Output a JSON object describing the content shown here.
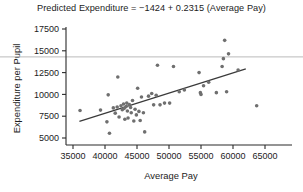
{
  "chart_data": {
    "type": "scatter",
    "title": "Predicted Expenditure = −1424 + 0.2315 (Average Pay)",
    "xlabel": "Average Pay",
    "ylabel": "Expenditure per Pupil",
    "xlim": [
      33500,
      66500
    ],
    "ylim": [
      4600,
      18100
    ],
    "xticks": [
      35000,
      40000,
      45000,
      50000,
      55000,
      60000,
      65000
    ],
    "yticks": [
      5000,
      7500,
      10000,
      12500,
      15000,
      17500
    ],
    "xtick_labels": [
      "35000",
      "40000",
      "45000",
      "50000",
      "55000",
      "60000",
      "65000"
    ],
    "ytick_labels": [
      "5000",
      "7500",
      "10000",
      "12500",
      "15000",
      "17500"
    ],
    "grid": false,
    "legend": null,
    "point_color": "#6f6f6f",
    "line_color": "#3a3a3a",
    "axis_color": "#2a2a2a",
    "reference_line_color": "#bbbbbb",
    "series": [
      {
        "name": "States",
        "marker": "circle",
        "points": [
          [
            36100,
            8150
          ],
          [
            39300,
            8200
          ],
          [
            40300,
            6850
          ],
          [
            40500,
            9950
          ],
          [
            40700,
            5550
          ],
          [
            41300,
            8450
          ],
          [
            41600,
            7850
          ],
          [
            41900,
            8550
          ],
          [
            42000,
            12000
          ],
          [
            42200,
            7400
          ],
          [
            42500,
            8700
          ],
          [
            42700,
            8250
          ],
          [
            42900,
            8900
          ],
          [
            43000,
            8400
          ],
          [
            43100,
            7150
          ],
          [
            43300,
            8600
          ],
          [
            43400,
            9000
          ],
          [
            43500,
            8100
          ],
          [
            43600,
            7300
          ],
          [
            43800,
            8850
          ],
          [
            44000,
            8500
          ],
          [
            44100,
            7900
          ],
          [
            44300,
            9300
          ],
          [
            44500,
            6950
          ],
          [
            44700,
            8300
          ],
          [
            44900,
            7650
          ],
          [
            45100,
            10700
          ],
          [
            45300,
            8050
          ],
          [
            45500,
            7000
          ],
          [
            45700,
            9700
          ],
          [
            46000,
            7900
          ],
          [
            46200,
            5700
          ],
          [
            46800,
            9800
          ],
          [
            47300,
            10100
          ],
          [
            47600,
            8800
          ],
          [
            48000,
            9900
          ],
          [
            48200,
            13350
          ],
          [
            48600,
            8800
          ],
          [
            49300,
            9000
          ],
          [
            50100,
            9000
          ],
          [
            50700,
            13200
          ],
          [
            51600,
            10300
          ],
          [
            52400,
            10500
          ],
          [
            54700,
            12500
          ],
          [
            54900,
            10200
          ],
          [
            55000,
            10000
          ],
          [
            55400,
            11000
          ],
          [
            56200,
            11400
          ],
          [
            57400,
            10200
          ],
          [
            58300,
            13200
          ],
          [
            58500,
            14100
          ],
          [
            58700,
            16200
          ],
          [
            59000,
            10300
          ],
          [
            59300,
            14650
          ],
          [
            60800,
            12800
          ],
          [
            63700,
            8700
          ]
        ]
      }
    ],
    "fit_line": {
      "name": "least-squares regression line",
      "intercept": -1424,
      "slope": 0.2315,
      "x_start": 36000,
      "x_end": 62000,
      "y_start": 6910,
      "y_end": 12929
    },
    "reference_line": {
      "name": "horizontal reference line",
      "y": 14300,
      "spans_full_width": true
    }
  }
}
